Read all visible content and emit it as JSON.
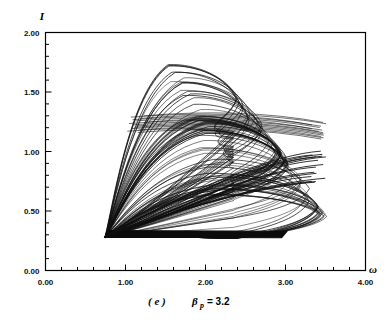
{
  "figure": {
    "caption_label": "( e )",
    "caption_param": "β",
    "caption_subscript": "p",
    "caption_equals": "= 3.2",
    "caption_full": "( e )  βp = 3.2"
  },
  "axes": {
    "ylabel": "I",
    "xlabel": "ω",
    "x_ticklabels": [
      "0.00",
      "1.00",
      "2.00",
      "3.00",
      "4.00"
    ],
    "y_ticklabels": [
      "0.00",
      "0.50",
      "1.00",
      "1.50",
      "2.00"
    ]
  },
  "chart_data": {
    "type": "line",
    "title": "",
    "subtitle": "( e )  βp = 3.2",
    "xlabel": "ω",
    "ylabel": "I",
    "xlim": [
      0.0,
      4.0
    ],
    "ylim": [
      0.0,
      2.0
    ],
    "xticks": [
      0.0,
      1.0,
      2.0,
      3.0,
      4.0
    ],
    "yticks": [
      0.0,
      0.5,
      1.0,
      1.5,
      2.0
    ],
    "x_minor_tick_step": 0.2,
    "y_minor_tick_step": 0.1,
    "grid": false,
    "legend": null,
    "line_color": "#101010",
    "line_width": 0.5,
    "attractor": {
      "n_loops": 68,
      "omega_range_visited": [
        0.72,
        3.58
      ],
      "intensity_range_visited": [
        0.26,
        1.8
      ],
      "vertex_omega": 0.74,
      "vertex_intensity": 0.28,
      "upper_arc_peak_intensity": 1.8,
      "dense_band_intensity": [
        1.15,
        1.3
      ],
      "lower_dense_edge_intensity": 0.27,
      "right_lobe_omega": 3.55,
      "crossing_omega": 2.35,
      "crossing_intensity": 0.78
    },
    "series": [
      {
        "name": "trajectory",
        "note": "Parametric family of loops; generated deterministically from the attractor parameters above."
      }
    ]
  }
}
